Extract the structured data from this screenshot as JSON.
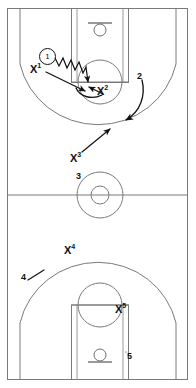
{
  "diagram": {
    "court_color": "#ffffff",
    "line_color": "#7a7a7a",
    "play_color": "#111111"
  },
  "court": {
    "orientation": "vertical-full-court",
    "bounds": {
      "x": 7,
      "y": 8,
      "width": 181,
      "height": 372
    },
    "halfcourt_line_y": 195,
    "center_circle": {
      "cx": 100,
      "cy": 195,
      "r_outer": 23,
      "r_inner": 9
    },
    "top_basket": {
      "rim_cx": 100,
      "rim_cy": 30,
      "rim_r": 6,
      "backboard_y": 23
    },
    "bottom_basket": {
      "rim_cx": 100,
      "rim_cy": 354,
      "rim_r": 6,
      "backboard_y": 362
    }
  },
  "players": [
    {
      "id": "offense-1",
      "label": "1",
      "marker": "circled-number",
      "role": "offense",
      "x": 46,
      "y": 55,
      "action": "dribble"
    },
    {
      "id": "defense-x1",
      "label": "X",
      "superscript": "1",
      "marker": "x-label",
      "role": "defense",
      "x": 33,
      "y": 66
    },
    {
      "id": "defense-x2",
      "label": "X",
      "superscript": "2",
      "marker": "x-label",
      "role": "defense",
      "x": 100,
      "y": 86
    },
    {
      "id": "defense-x3",
      "label": "X",
      "superscript": "3",
      "marker": "x-label",
      "role": "defense",
      "x": 72,
      "y": 153
    },
    {
      "id": "defense-x4",
      "label": "X",
      "superscript": "4",
      "marker": "x-label",
      "role": "defense",
      "x": 66,
      "y": 245
    },
    {
      "id": "defense-x5",
      "label": "X",
      "superscript": "5",
      "marker": "x-label",
      "role": "defense",
      "x": 118,
      "y": 305
    }
  ],
  "callouts": [
    {
      "id": "callout-2",
      "label": "2",
      "x": 139,
      "y": 74
    },
    {
      "id": "callout-3",
      "label": "3",
      "x": 77,
      "y": 173
    },
    {
      "id": "callout-4",
      "label": "4",
      "x": 22,
      "y": 274
    },
    {
      "id": "callout-5",
      "label": "5",
      "x": 128,
      "y": 353
    }
  ],
  "movements": [
    {
      "id": "dribble-1-to-lane",
      "type": "dribble-zigzag",
      "from": "offense-1",
      "to_x": 86,
      "to_y": 86
    },
    {
      "id": "x1-close-out",
      "type": "straight-arrow",
      "from": "defense-x1",
      "to_x": 86,
      "to_y": 92
    },
    {
      "id": "x2-rotation",
      "type": "straight-arrow",
      "from": "defense-x2",
      "to_x": 88,
      "to_y": 84
    },
    {
      "id": "callout-2-arrow",
      "type": "curved-arrow",
      "from": "callout-2",
      "to_x": 123,
      "to_y": 122
    },
    {
      "id": "x3-rotation",
      "type": "straight-arrow",
      "from": "defense-x3",
      "to_x": 112,
      "to_y": 127
    }
  ]
}
